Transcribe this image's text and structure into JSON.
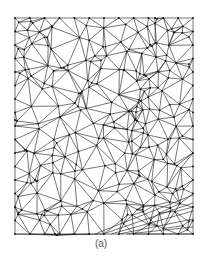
{
  "figure": {
    "caption": "(a)",
    "mesh": {
      "bounds": {
        "x0": 15,
        "y0": 18,
        "x1": 193,
        "y1": 234
      },
      "stroke_color": "#1a1a1a",
      "stroke_width": 0.6,
      "node_color": "#111111",
      "seed": 7,
      "point_count": 240,
      "features": [
        {
          "type": "curve",
          "points": [
            [
              155,
              18
            ],
            [
              150,
              45
            ],
            [
              144,
              75
            ],
            [
              139,
              100
            ],
            [
              135,
              120
            ]
          ]
        },
        {
          "type": "curve",
          "points": [
            [
              15,
              120
            ],
            [
              25,
              150
            ],
            [
              35,
              180
            ],
            [
              45,
              210
            ],
            [
              55,
              234
            ]
          ]
        },
        {
          "type": "fan",
          "from": [
            95,
            234
          ],
          "to": [
            [
              193,
              195
            ],
            [
              193,
              203
            ],
            [
              193,
              211
            ],
            [
              193,
              219
            ],
            [
              193,
              227
            ],
            [
              193,
              234
            ]
          ]
        }
      ]
    }
  }
}
